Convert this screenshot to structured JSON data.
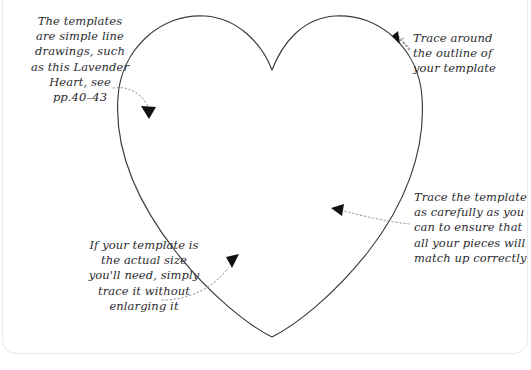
{
  "page": {
    "background_color": "#ffffff",
    "border_color": "#e8e8ec",
    "ink_color": "#2b2b30"
  },
  "illustration": {
    "name": "lavender-heart-template-outline",
    "shape": "heart",
    "stroke_color": "#3a3a40",
    "fill": "none"
  },
  "annotations": [
    {
      "id": "templates",
      "text": "The templates\nare simple line\ndrawings, such\nas this Lavender\nHeart, see\npp.40–43",
      "align": "center",
      "leader": "dotted-curve",
      "arrow": "down-right"
    },
    {
      "id": "trace-outline",
      "text": "Trace around\nthe outline of\nyour template",
      "align": "left",
      "leader": "dotted-curve",
      "arrow": "up-left"
    },
    {
      "id": "trace-carefully",
      "text": "Trace the template\nas carefully as you\ncan to ensure that\nall your pieces will\nmatch up correctly",
      "align": "left",
      "leader": "dotted-curve",
      "arrow": "left"
    },
    {
      "id": "actual-size",
      "text": "If your template is\nthe actual size\nyou'll need, simply\ntrace it without\nenlarging it",
      "align": "center",
      "leader": "dotted-curve",
      "arrow": "up-right"
    }
  ]
}
